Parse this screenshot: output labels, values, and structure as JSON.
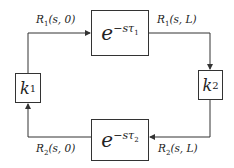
{
  "diagram": {
    "type": "feedback loop block diagram",
    "blocks": {
      "delay_top": {
        "base": "e",
        "exponent": "−sτ",
        "exponent_sub": "1"
      },
      "delay_bottom": {
        "base": "e",
        "exponent": "−sτ",
        "exponent_sub": "2"
      },
      "gain_left": {
        "symbol": "k",
        "sub": "1"
      },
      "gain_right": {
        "symbol": "k",
        "sub": "2"
      }
    },
    "signals": {
      "r1_0": {
        "name": "R",
        "sub": "1",
        "args": "(s, 0)"
      },
      "r1_L": {
        "name": "R",
        "sub": "1",
        "args": "(s, L)"
      },
      "r2_0": {
        "name": "R",
        "sub": "2",
        "args": "(s, 0)"
      },
      "r2_L": {
        "name": "R",
        "sub": "2",
        "args": "(s, L)"
      }
    },
    "colors": {
      "line": "#333333",
      "text": "#222222",
      "background": "#ffffff"
    }
  }
}
